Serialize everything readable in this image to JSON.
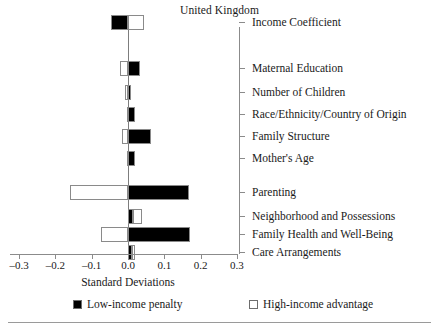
{
  "chart_data": {
    "type": "bar",
    "orientation": "horizontal",
    "title": "United Kingdom",
    "xlabel": "Standard Deviations",
    "ylabel": "",
    "xlim": [
      -0.3,
      0.3
    ],
    "xticks": [
      "–0.3",
      "–0.2",
      "–0.1",
      "0.0",
      "0.1",
      "0.2",
      "0.3"
    ],
    "xtick_values": [
      -0.3,
      -0.2,
      -0.1,
      0.0,
      0.1,
      0.2,
      0.3
    ],
    "grid": false,
    "legend_position": "bottom",
    "categories": [
      "Income Coefficient",
      "Maternal Education",
      "Number of Children",
      "Race/Ethnicity/Country of Origin",
      "Family Structure",
      "Mother's Age",
      "Parenting",
      "Neighborhood and Possessions",
      "Family Health and Well-Being",
      "Care Arrangements"
    ],
    "series": [
      {
        "name": "Low-income penalty",
        "color": "#000000",
        "values": [
          -0.046,
          0.033,
          0.008,
          0.018,
          0.063,
          0.018,
          0.168,
          0.015,
          0.17,
          0.012
        ]
      },
      {
        "name": "High-income advantage",
        "color": "#ffffff",
        "values": [
          0.043,
          -0.022,
          -0.008,
          -0.003,
          -0.017,
          -0.004,
          -0.16,
          0.038,
          -0.075,
          0.006
        ]
      }
    ]
  },
  "chart": {
    "title": "United Kingdom",
    "xlabel": "Standard Deviations",
    "ticks": [
      {
        "label": "–0.3",
        "value": -0.3
      },
      {
        "label": "–0.2",
        "value": -0.2
      },
      {
        "label": "–0.1",
        "value": -0.1
      },
      {
        "label": "0.0",
        "value": 0.0
      },
      {
        "label": "0.1",
        "value": 0.1
      },
      {
        "label": "0.2",
        "value": 0.2
      },
      {
        "label": "0.3",
        "value": 0.3
      }
    ],
    "rows": [
      {
        "label": "Income Coefficient",
        "y": 22,
        "black_from": -0.046,
        "black_to": 0.0,
        "white_from": 0.0,
        "white_to": 0.043
      },
      {
        "label": "Maternal Education",
        "y": 68,
        "black_from": 0.0,
        "black_to": 0.033,
        "white_from": -0.022,
        "white_to": 0.0
      },
      {
        "label": "Number of Children",
        "y": 92,
        "black_from": 0.0,
        "black_to": 0.008,
        "white_from": -0.008,
        "white_to": 0.0
      },
      {
        "label": "Race/Ethnicity/Country of Origin",
        "y": 114,
        "black_from": 0.0,
        "black_to": 0.018,
        "white_from": -0.003,
        "white_to": 0.0
      },
      {
        "label": "Family Structure",
        "y": 136,
        "black_from": 0.0,
        "black_to": 0.063,
        "white_from": -0.017,
        "white_to": 0.0
      },
      {
        "label": "Mother's Age",
        "y": 158,
        "black_from": 0.0,
        "black_to": 0.018,
        "white_from": -0.004,
        "white_to": 0.0
      },
      {
        "label": "Parenting",
        "y": 192,
        "black_from": 0.0,
        "black_to": 0.168,
        "white_from": -0.16,
        "white_to": 0.0
      },
      {
        "label": "Neighborhood and Possessions",
        "y": 216,
        "black_from": 0.0,
        "black_to": 0.015,
        "white_from": 0.015,
        "white_to": 0.038
      },
      {
        "label": "Family Health and Well-Being",
        "y": 234,
        "black_from": 0.0,
        "black_to": 0.17,
        "white_from": -0.075,
        "white_to": 0.0
      },
      {
        "label": "Care Arrangements",
        "y": 252,
        "black_from": 0.0,
        "black_to": 0.012,
        "white_from": 0.012,
        "white_to": 0.018
      }
    ],
    "legend": [
      {
        "label": "Low-income penalty",
        "swatch": "filled"
      },
      {
        "label": "High-income advantage",
        "swatch": "hollow"
      }
    ]
  }
}
